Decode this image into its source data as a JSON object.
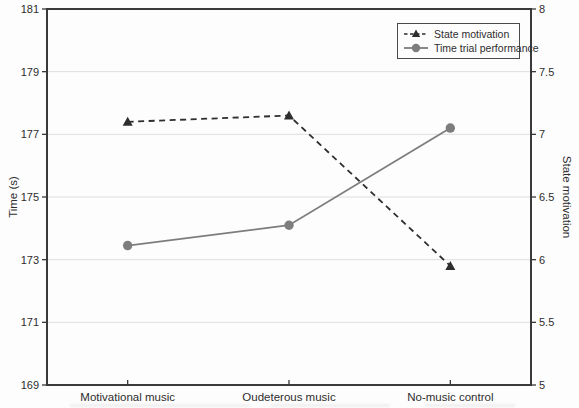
{
  "chart_data": {
    "type": "line",
    "title": "",
    "categories": [
      "Motivational music",
      "Oudeterous music",
      "No-music control"
    ],
    "series": [
      {
        "name": "State motivation",
        "axis": "right",
        "line_style": "dashed",
        "marker": "triangle",
        "color": "#2e2e2e",
        "values": [
          7.1,
          7.15,
          5.95
        ]
      },
      {
        "name": "Time trial performance",
        "axis": "left",
        "line_style": "solid",
        "marker": "circle",
        "color": "#7d7d7d",
        "values": [
          173.45,
          174.1,
          177.2
        ]
      }
    ],
    "left_axis": {
      "label": "Time (s)",
      "min": 169,
      "max": 181,
      "ticks": [
        169,
        171,
        173,
        175,
        177,
        179,
        181
      ]
    },
    "right_axis": {
      "label": "State motivation",
      "min": 5,
      "max": 8,
      "ticks": [
        5,
        5.5,
        6,
        6.5,
        7,
        7.5,
        8
      ]
    },
    "grid": "horizontal",
    "legend": {
      "position": "top-right",
      "border": true
    },
    "colors": {
      "grid": "#dedede",
      "spine": "#3a3a3a",
      "text": "#2d2d2d",
      "background": "#fdfdfd"
    }
  }
}
